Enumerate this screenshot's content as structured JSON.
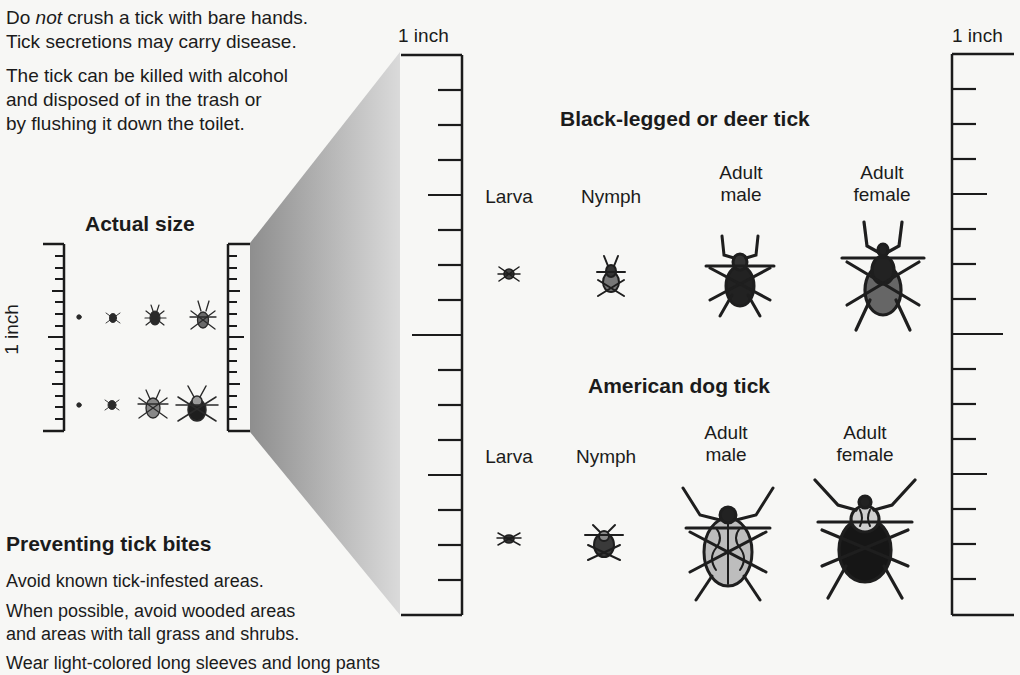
{
  "intro": {
    "line1_pre": "Do ",
    "line1_em": "not",
    "line1_post": " crush a tick with bare hands.",
    "line2": "Tick secretions may carry disease.",
    "line3": "The tick can be killed with alcohol",
    "line4": "and disposed of in the trash or",
    "line5": "by flushing it down the toilet."
  },
  "actual_size": {
    "title": "Actual size",
    "ruler_label": "1 inch"
  },
  "main_ruler": {
    "label": "1 inch"
  },
  "right_ruler": {
    "label": "1 inch"
  },
  "deer_tick": {
    "title": "Black-legged or deer tick",
    "stages": [
      {
        "line1": "",
        "line2": "Larva"
      },
      {
        "line1": "",
        "line2": "Nymph"
      },
      {
        "line1": "Adult",
        "line2": "male"
      },
      {
        "line1": "Adult",
        "line2": "female"
      }
    ]
  },
  "dog_tick": {
    "title": "American dog tick",
    "stages": [
      {
        "line1": "",
        "line2": "Larva"
      },
      {
        "line1": "",
        "line2": "Nymph"
      },
      {
        "line1": "Adult",
        "line2": "male"
      },
      {
        "line1": "Adult",
        "line2": "female"
      }
    ]
  },
  "prevention": {
    "title": "Preventing tick bites",
    "line1": "Avoid known tick-infested areas.",
    "line2": "When possible, avoid wooded areas",
    "line3": "and areas with tall grass and shrubs.",
    "line4": "Wear light-colored long sleeves and long pants"
  },
  "colors": {
    "ink": "#1b1b1b",
    "paper": "#f7f7f5",
    "funnel_dark": "#8e8e8e",
    "funnel_light": "#d6d6d6"
  }
}
